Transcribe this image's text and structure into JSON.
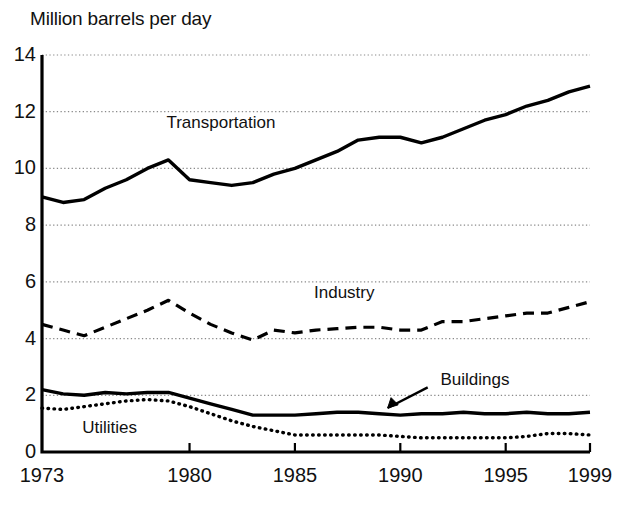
{
  "chart_data": {
    "type": "line",
    "title": "Million barrels per day",
    "xlabel": "",
    "ylabel": "Million barrels per day",
    "xlim": [
      1973,
      1999
    ],
    "ylim": [
      0,
      14
    ],
    "ytick_labels": [
      "0",
      "2",
      "4",
      "6",
      "8",
      "10",
      "12",
      "14"
    ],
    "ytick_values": [
      0,
      2,
      4,
      6,
      8,
      10,
      12,
      14
    ],
    "xtick_labels": [
      "1973",
      "1980",
      "1985",
      "1990",
      "1995",
      "1999"
    ],
    "xtick_values": [
      1973,
      1980,
      1985,
      1990,
      1995,
      1999
    ],
    "grid": "horizontal-dotted",
    "legend": "inline-annotations",
    "x": [
      1973,
      1974,
      1975,
      1976,
      1977,
      1978,
      1979,
      1980,
      1981,
      1982,
      1983,
      1984,
      1985,
      1986,
      1987,
      1988,
      1989,
      1990,
      1991,
      1992,
      1993,
      1994,
      1995,
      1996,
      1997,
      1998,
      1999
    ],
    "series": [
      {
        "name": "Transportation",
        "style": "solid-thick",
        "label_x": 1979,
        "label_y": 11.6,
        "values": [
          9.0,
          8.8,
          8.9,
          9.3,
          9.6,
          10.0,
          10.3,
          9.6,
          9.5,
          9.4,
          9.5,
          9.8,
          10.0,
          10.3,
          10.6,
          11.0,
          11.1,
          11.1,
          10.9,
          11.1,
          11.4,
          11.7,
          11.9,
          12.2,
          12.4,
          12.7,
          12.9
        ]
      },
      {
        "name": "Industry",
        "style": "dashed",
        "label_x": 1986,
        "label_y": 5.6,
        "values": [
          4.5,
          4.3,
          4.1,
          4.4,
          4.7,
          5.0,
          5.35,
          4.9,
          4.5,
          4.2,
          3.95,
          4.3,
          4.2,
          4.3,
          4.35,
          4.4,
          4.4,
          4.3,
          4.3,
          4.6,
          4.6,
          4.7,
          4.8,
          4.9,
          4.9,
          5.1,
          5.3
        ]
      },
      {
        "name": "Buildings",
        "style": "solid-thick",
        "label_x": 1992,
        "label_y": 2.55,
        "annotation": "arrow-to-line",
        "values": [
          2.2,
          2.05,
          2.0,
          2.1,
          2.05,
          2.1,
          2.1,
          1.9,
          1.7,
          1.5,
          1.3,
          1.3,
          1.3,
          1.35,
          1.4,
          1.4,
          1.35,
          1.3,
          1.35,
          1.35,
          1.4,
          1.35,
          1.35,
          1.4,
          1.35,
          1.35,
          1.4
        ]
      },
      {
        "name": "Utilities",
        "style": "dotted",
        "label_x": 1975,
        "label_y": 0.85,
        "values": [
          1.55,
          1.5,
          1.6,
          1.7,
          1.8,
          1.85,
          1.8,
          1.6,
          1.35,
          1.1,
          0.9,
          0.75,
          0.6,
          0.6,
          0.6,
          0.6,
          0.6,
          0.55,
          0.5,
          0.5,
          0.5,
          0.5,
          0.5,
          0.55,
          0.65,
          0.65,
          0.6
        ]
      }
    ]
  },
  "colors": {
    "line": "#000000",
    "grid": "#8a8a8a",
    "text": "#111111",
    "background": "#ffffff"
  }
}
